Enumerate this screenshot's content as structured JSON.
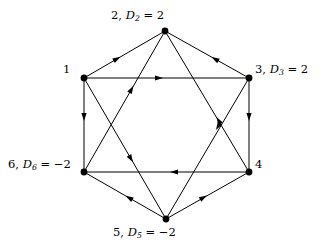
{
  "figure": {
    "kind": "directed-graph",
    "shape": "hexagon-with-inscribed-star",
    "stroke_color": "#000000",
    "background_color": "#ffffff"
  },
  "nodes": [
    {
      "id": "1",
      "label_html": "1",
      "index": "1",
      "demand_symbol": null,
      "demand_value": null,
      "x": 84,
      "y": 78
    },
    {
      "id": "2",
      "label_html": "2, D2 = 2",
      "index": "2",
      "demand_symbol": "D",
      "demand_sub": "2",
      "demand_value": "2",
      "x": 165,
      "y": 31
    },
    {
      "id": "3",
      "label_html": "3, D3 = 2",
      "index": "3",
      "demand_symbol": "D",
      "demand_sub": "3",
      "demand_value": "2",
      "x": 249,
      "y": 78
    },
    {
      "id": "4",
      "label_html": "4",
      "index": "4",
      "demand_symbol": null,
      "demand_value": null,
      "x": 249,
      "y": 172
    },
    {
      "id": "5",
      "label_html": "5, D5 = -2",
      "index": "5",
      "demand_symbol": "D",
      "demand_sub": "5",
      "demand_value": "-2",
      "x": 166,
      "y": 219
    },
    {
      "id": "6",
      "label_html": "6, D6 = -2",
      "index": "6",
      "demand_symbol": "D",
      "demand_sub": "6",
      "demand_value": "-2",
      "x": 84,
      "y": 172
    }
  ],
  "labels": {
    "node1": {
      "index": "1",
      "separator": "",
      "demand": "",
      "equals": "",
      "value": ""
    },
    "node2": {
      "index": "2",
      "separator": ", ",
      "demand": "D",
      "sub": "2",
      "equals": " = ",
      "value": "2"
    },
    "node3": {
      "index": "3",
      "separator": ", ",
      "demand": "D",
      "sub": "3",
      "equals": " = ",
      "value": "2"
    },
    "node4": {
      "index": "4",
      "separator": "",
      "demand": "",
      "equals": "",
      "value": ""
    },
    "node5": {
      "index": "5",
      "separator": ", ",
      "demand": "D",
      "sub": "5",
      "equals": " = ",
      "value": "−2"
    },
    "node6": {
      "index": "6",
      "separator": ", ",
      "demand": "D",
      "sub": "6",
      "equals": " = ",
      "value": "−2"
    }
  },
  "edges": [
    {
      "from": "2",
      "to": "1",
      "group": "outer-hexagon"
    },
    {
      "from": "2",
      "to": "3",
      "group": "outer-hexagon"
    },
    {
      "from": "6",
      "to": "1",
      "group": "outer-hexagon"
    },
    {
      "from": "4",
      "to": "3",
      "group": "outer-hexagon"
    },
    {
      "from": "6",
      "to": "5",
      "group": "outer-hexagon"
    },
    {
      "from": "4",
      "to": "5",
      "group": "outer-hexagon"
    },
    {
      "from": "3",
      "to": "1",
      "group": "inner-star"
    },
    {
      "from": "6",
      "to": "4",
      "group": "inner-star"
    },
    {
      "from": "2",
      "to": "6",
      "group": "inner-star"
    },
    {
      "from": "2",
      "to": "4",
      "group": "inner-star"
    },
    {
      "from": "5",
      "to": "1",
      "group": "inner-star"
    },
    {
      "from": "5",
      "to": "3",
      "group": "inner-star"
    }
  ]
}
